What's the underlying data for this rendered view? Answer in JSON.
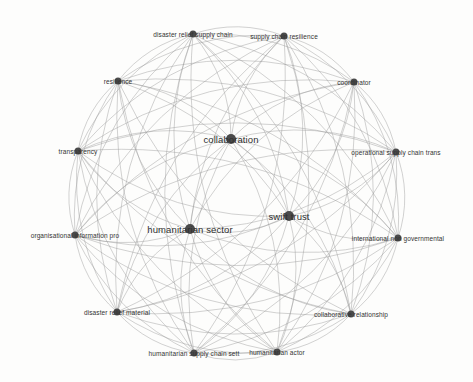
{
  "diagram": {
    "type": "co-occurrence keyword network",
    "edge_color": "#9a9a9a",
    "node_color": "#4a4a4a",
    "label_color": "#333333",
    "nodes": [
      {
        "id": "drsc",
        "label": "disaster relief supply chain",
        "x": 193,
        "y": 34,
        "r": 3.5,
        "size": "small"
      },
      {
        "id": "scr",
        "label": "supply chain resilience",
        "x": 284,
        "y": 36,
        "r": 3.5,
        "size": "small"
      },
      {
        "id": "res",
        "label": "resilience",
        "x": 118,
        "y": 81,
        "r": 3.5,
        "size": "small"
      },
      {
        "id": "coord",
        "label": "coordinator",
        "x": 354,
        "y": 82,
        "r": 3.5,
        "size": "small"
      },
      {
        "id": "collab",
        "label": "collaboration",
        "x": 231,
        "y": 139,
        "r": 5,
        "size": "big"
      },
      {
        "id": "trans",
        "label": "transparency",
        "x": 78,
        "y": 151,
        "r": 3.5,
        "size": "small"
      },
      {
        "id": "opsc",
        "label": "operational supply chain trans",
        "x": 396,
        "y": 152,
        "r": 3.5,
        "size": "small"
      },
      {
        "id": "swift",
        "label": "swift trust",
        "x": 289,
        "y": 216,
        "r": 5,
        "size": "big"
      },
      {
        "id": "hsector",
        "label": "humanitarian sector",
        "x": 190,
        "y": 229,
        "r": 5,
        "size": "big"
      },
      {
        "id": "orginfo",
        "label": "organisational information pro",
        "x": 75,
        "y": 235,
        "r": 3.5,
        "size": "small"
      },
      {
        "id": "ingo",
        "label": "international non governmental",
        "x": 398,
        "y": 238,
        "r": 3.5,
        "size": "small"
      },
      {
        "id": "drm",
        "label": "disaster relief material",
        "x": 117,
        "y": 312,
        "r": 3.5,
        "size": "small"
      },
      {
        "id": "crel",
        "label": "collaborative relationship",
        "x": 351,
        "y": 314,
        "r": 3.5,
        "size": "small"
      },
      {
        "id": "hscs",
        "label": "humanitarian supply chain sett",
        "x": 194,
        "y": 353,
        "r": 3.5,
        "size": "small"
      },
      {
        "id": "hactor",
        "label": "humanitarian actor",
        "x": 277,
        "y": 352,
        "r": 3.5,
        "size": "small"
      }
    ]
  }
}
